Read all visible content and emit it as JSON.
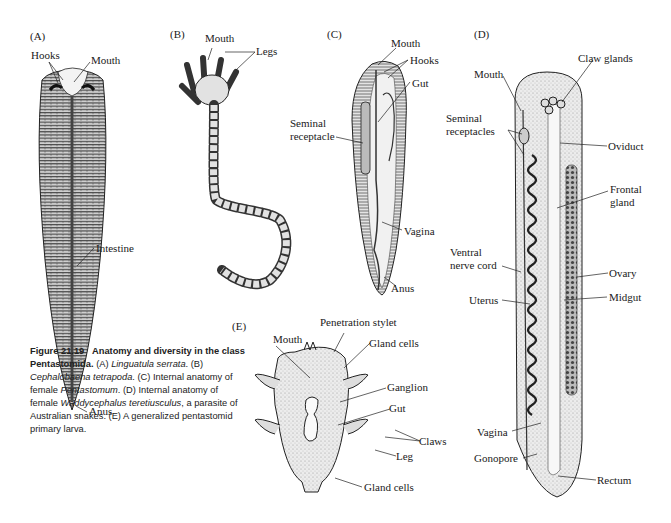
{
  "figure": {
    "number": "Figure 21.19",
    "title": "Anatomy and diversity in the class Pentastomida.",
    "caption_parts": [
      {
        "text": "(A) ",
        "style": "normal"
      },
      {
        "text": "Linguatula serrata",
        "style": "italic"
      },
      {
        "text": ". (B) ",
        "style": "normal"
      },
      {
        "text": "Cephalobaena tetrapoda",
        "style": "italic"
      },
      {
        "text": ". (C) Internal anatomy of female ",
        "style": "normal"
      },
      {
        "text": "Pentastomum",
        "style": "italic"
      },
      {
        "text": ". (D) Internal anatomy of female ",
        "style": "normal"
      },
      {
        "text": "Waddycephalus teretiusculus",
        "style": "italic"
      },
      {
        "text": ", a parasite of Australian snakes. (E) A generalized pentastomid primary larva.",
        "style": "normal"
      }
    ]
  },
  "panels": {
    "A": {
      "tag": "(A)",
      "labels": {
        "hooks": "Hooks",
        "mouth": "Mouth",
        "intestine": "Intestine",
        "anus": "Anus"
      }
    },
    "B": {
      "tag": "(B)",
      "labels": {
        "mouth": "Mouth",
        "legs": "Legs"
      }
    },
    "C": {
      "tag": "(C)",
      "labels": {
        "mouth": "Mouth",
        "hooks": "Hooks",
        "gut": "Gut",
        "seminal_1": "Seminal",
        "seminal_2": "receptacle",
        "vagina": "Vagina",
        "anus": "Anus"
      }
    },
    "D": {
      "tag": "(D)",
      "labels": {
        "mouth": "Mouth",
        "claw_glands": "Claw glands",
        "seminal_1": "Seminal",
        "seminal_2": "receptacles",
        "oviduct": "Oviduct",
        "frontal_1": "Frontal",
        "frontal_2": "gland",
        "ventral_1": "Ventral",
        "ventral_2": "nerve cord",
        "ovary": "Ovary",
        "uterus": "Uterus",
        "midgut": "Midgut",
        "vagina": "Vagina",
        "gonopore": "Gonopore",
        "rectum": "Rectum"
      }
    },
    "E": {
      "tag": "(E)",
      "labels": {
        "stylet": "Penetration stylet",
        "mouth": "Mouth",
        "gland_cells_top": "Gland cells",
        "ganglion": "Ganglion",
        "gut": "Gut",
        "claws": "Claws",
        "leg": "Leg",
        "gland_cells_bottom": "Gland cells"
      }
    }
  }
}
